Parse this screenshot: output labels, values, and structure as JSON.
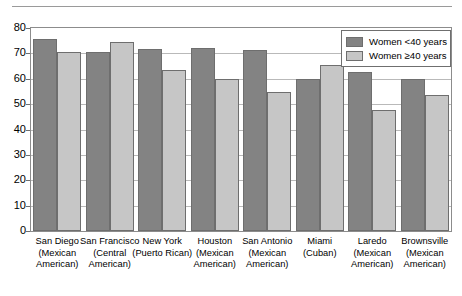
{
  "chart_data": {
    "type": "bar",
    "title": "",
    "xlabel": "",
    "ylabel": "",
    "ylim": [
      0,
      80
    ],
    "ytick_step": 10,
    "yticks": [
      "80",
      "70",
      "60",
      "50",
      "40",
      "30",
      "20",
      "10",
      "0"
    ],
    "grid": true,
    "legend_position": "top-right",
    "categories": [
      "San Diego\n(Mexican\nAmerican)",
      "San Francisco\n(Central\nAmerican)",
      "New York\n(Puerto Rican)",
      "Houston\n(Mexican\nAmerican)",
      "San Antonio\n(Mexican\nAmerican)",
      "Miami\n(Cuban)",
      "Laredo\n(Mexican\nAmerican)",
      "Brownsville\n(Mexican\nAmerican)"
    ],
    "series": [
      {
        "name": "Women <40 years",
        "color": "#838383",
        "values": [
          75.5,
          70.5,
          71.8,
          72.2,
          71.5,
          60.0,
          62.5,
          60.0
        ]
      },
      {
        "name": "Women ≥40 years",
        "color": "#c6c6c6",
        "values": [
          70.5,
          74.3,
          63.5,
          59.8,
          54.8,
          65.3,
          47.5,
          53.5
        ]
      }
    ]
  },
  "legend": {
    "items": [
      {
        "label": "Women <40 years",
        "swatch": "dark"
      },
      {
        "label": "Women ≥40 years",
        "swatch": "light"
      }
    ]
  }
}
